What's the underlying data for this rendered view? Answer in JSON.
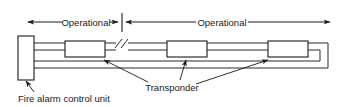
{
  "diagram": {
    "labels": {
      "operational_left": "Operational",
      "operational_right": "Operational",
      "transponder": "Transponder",
      "fire_alarm_control_unit": "Fire alarm control unit"
    },
    "colors": {
      "line": "#2b2b2b",
      "text": "#1a1a1a",
      "background": "#ffffff",
      "box_fill": "#ffffff"
    },
    "components": [
      {
        "name": "fire-alarm-control-unit",
        "type": "panel",
        "x": 18,
        "y": 36,
        "width": 16,
        "height": 44
      },
      {
        "name": "transponder-1",
        "type": "transponder",
        "x": 65,
        "y": 41,
        "width": 40,
        "height": 16
      },
      {
        "name": "transponder-2",
        "type": "transponder",
        "x": 167,
        "y": 41,
        "width": 40,
        "height": 16
      },
      {
        "name": "transponder-3",
        "type": "transponder",
        "x": 268,
        "y": 41,
        "width": 40,
        "height": 16
      }
    ],
    "wire_pairs": {
      "upper": [
        43,
        50
      ],
      "lower": [
        61,
        68
      ]
    },
    "break_symbol": {
      "x": 120,
      "y": 47,
      "note": "conductor break / continuation"
    },
    "dimensions": [
      {
        "name": "operational-left",
        "x1": 27,
        "x2": 118,
        "y": 22,
        "label": "Operational"
      },
      {
        "name": "operational-right",
        "x1": 126,
        "x2": 330,
        "y": 22,
        "label": "Operational"
      }
    ],
    "divider_tick": {
      "x": 122,
      "y_top": 13,
      "y_bottom": 32
    }
  }
}
